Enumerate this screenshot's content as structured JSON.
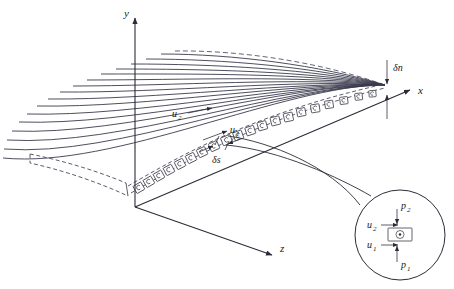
{
  "figure": {
    "background_color": "#ffffff",
    "line_color": "#3a3a4d",
    "axis_color": "#2b2b38"
  },
  "axes": [
    {
      "name": "y-axis",
      "label": "y",
      "direction": "up"
    },
    {
      "name": "x-axis",
      "label": "x",
      "direction": "right-up"
    },
    {
      "name": "z-axis",
      "label": "z",
      "direction": "right-down"
    }
  ],
  "annotations": {
    "u1": "u",
    "u1_sub": "1",
    "u2": "u",
    "u2_sub": "2",
    "delta_n": "δn",
    "delta_s": "δs"
  },
  "detail_circle": {
    "name": "detail-inset",
    "labels": {
      "u1": "u",
      "u1_sub": "1",
      "u2": "u",
      "u2_sub": "2",
      "p1": "p",
      "p1_sub": "1",
      "p2": "p",
      "p2_sub": "2"
    },
    "element_symbol": "vorticity-out-of-page"
  },
  "surface": {
    "streamline_count": 17,
    "vortex_cell_count": 19,
    "top_edge_style": "dashed",
    "bottom_edge_style": "dashed",
    "front_edge_style": "dashed"
  }
}
